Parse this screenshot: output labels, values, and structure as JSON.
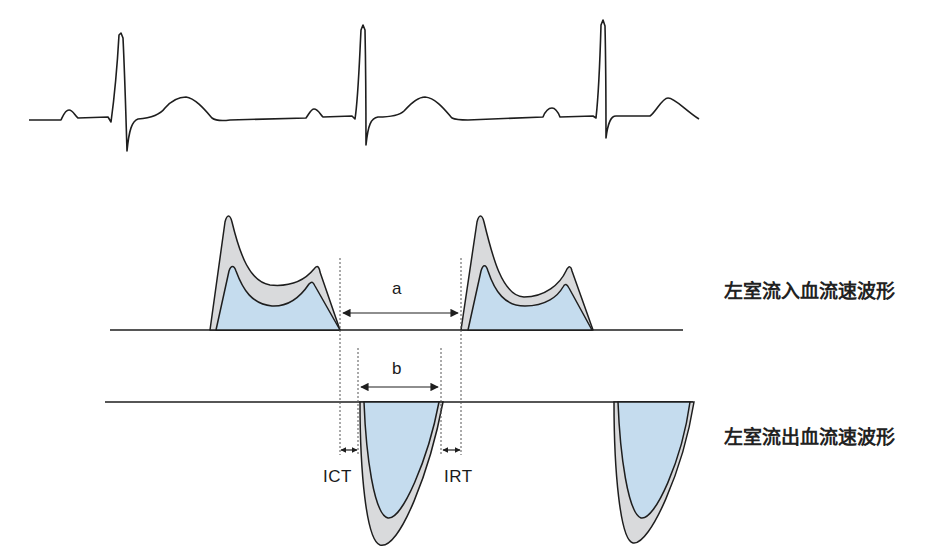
{
  "figure": {
    "title": "",
    "colors": {
      "line": "#1e1e1e",
      "outer_fill": "#d9dadc",
      "inner_fill": "#c5dcee",
      "guide": "#555555",
      "background": "#ffffff"
    },
    "ecg": {
      "name": "Electrocardiogram",
      "beats": 3,
      "components": [
        "P",
        "QRS",
        "T"
      ]
    },
    "waveforms": {
      "inflow": {
        "label": "左室流入血流速波形",
        "meaning": "Left ventricular inflow velocity waveform",
        "peaks": [
          "E",
          "A"
        ],
        "count": 2
      },
      "outflow": {
        "label": "左室流出血流速波形",
        "meaning": "Left ventricular outflow velocity waveform",
        "count": 2
      }
    },
    "intervals": {
      "a": {
        "label": "a",
        "description": "end of mitral inflow to start of next mitral inflow"
      },
      "b": {
        "label": "b",
        "description": "left ventricular ejection time"
      },
      "ict": {
        "label": "ICT",
        "description": "isovolumic contraction time"
      },
      "irt": {
        "label": "IRT",
        "description": "isovolumic relaxation time"
      }
    }
  }
}
